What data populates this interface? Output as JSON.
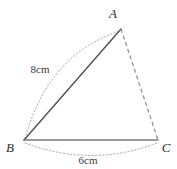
{
  "figure": {
    "type": "geometry-diagram",
    "shape": "triangle",
    "background_color": "#ffffff",
    "vertices": [
      {
        "name": "A",
        "label": "A",
        "x": 121,
        "y": 29,
        "label_x": 113,
        "label_y": 18
      },
      {
        "name": "B",
        "label": "B",
        "x": 24,
        "y": 140,
        "label_x": 9,
        "label_y": 152
      },
      {
        "name": "C",
        "label": "C",
        "x": 158,
        "y": 140,
        "label_x": 163,
        "label_y": 152
      }
    ],
    "edges": [
      {
        "name": "side-ba",
        "from": "B",
        "to": "A",
        "style": "solid",
        "color": "#4a4a55",
        "width": 1.3,
        "measure": "8cm"
      },
      {
        "name": "side-bc",
        "from": "B",
        "to": "C",
        "style": "solid",
        "color": "#7b7b80",
        "width": 1.5,
        "measure": "6cm"
      },
      {
        "name": "side-ac",
        "from": "A",
        "to": "C",
        "style": "dashed",
        "color": "#8a8a90",
        "width": 1.2,
        "measure": ""
      }
    ],
    "arcs": [
      {
        "name": "arc-ba-measure",
        "from": "B",
        "to": "A",
        "style": "dotted",
        "color": "#a8a8ae",
        "bulge": "outward-left",
        "path": "M 25 139 Q 48 54 120 31"
      },
      {
        "name": "arc-bc-measure",
        "from": "B",
        "to": "C",
        "style": "dotted",
        "color": "#a8a8ae",
        "bulge": "downward",
        "path": "M 25 143 Q 92 168 157 143"
      }
    ],
    "measure_labels": [
      {
        "name": "label-8cm",
        "text": "8cm",
        "x": 40,
        "y": 73,
        "for_edge": "side-ba"
      },
      {
        "name": "label-6cm",
        "text": "6cm",
        "x": 76,
        "y": 162,
        "for_edge": "side-bc"
      }
    ]
  }
}
